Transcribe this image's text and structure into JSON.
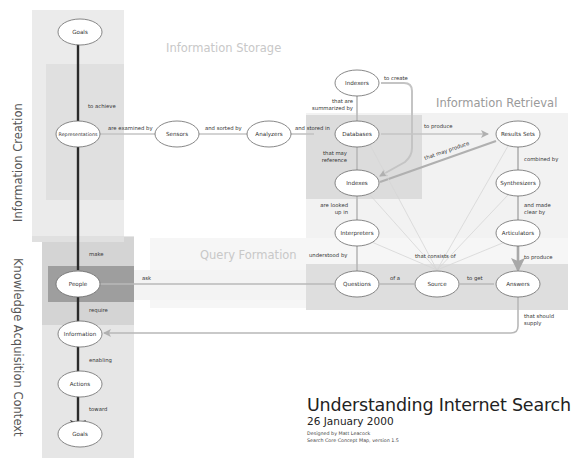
{
  "title": {
    "main": "Understanding Internet Search",
    "date": "26 January 2000",
    "designer": "Designed by Matt Leacock",
    "subtitle": "Search Core Concept Map, version 1.5"
  },
  "side_titles": {
    "information_creation": "Information Creation",
    "knowledge_acquisition": "Knowledge Acquisition Context"
  },
  "region_titles": {
    "information_storage": "Information Storage",
    "information_retrieval": "Information Retrieval",
    "query_formation": "Query Formation"
  },
  "colors": {
    "panel_light": "#ebebeb",
    "panel_mid": "#dcdcdc",
    "panel_dark": "#9e9e9e",
    "edge_gray": "#b5b5b5",
    "edge_dark": "#2a2a2a",
    "region_title": "#c8c8c8"
  },
  "nodes": {
    "goals_top": "Goals",
    "representations": "Representations",
    "sensors": "Sensors",
    "analyzers": "Analyzers",
    "indexers": "Indexers",
    "databases": "Databases",
    "indexes": "Indexes",
    "interpreters": "Interpreters",
    "results_sets": "Results Sets",
    "synthesizers": "Synthesizers",
    "articulators": "Articulators",
    "people": "People",
    "questions": "Questions",
    "source": "Source",
    "answers": "Answers",
    "information": "Information",
    "actions": "Actions",
    "goals_bottom": "Goals"
  },
  "edges": {
    "to_achieve": "to achieve",
    "are_examined_by": "are examined by",
    "and_sorted_by": "and sorted by",
    "and_stored_in": "and stored in",
    "to_create": "to create",
    "that_are": "that are",
    "summarized_by": "summarized by",
    "to_produce_results": "to produce",
    "that_may_produce": "that may produce",
    "that_may": "that may",
    "reference": "reference",
    "combined_by": "combined by",
    "are_looked": "are looked",
    "up_in": "up in",
    "and_made": "and made",
    "clear_by": "clear by",
    "make": "make",
    "understood_by": "understood by",
    "that_consists_of": "that consists of",
    "to_produce_answers": "to produce",
    "ask": "ask",
    "of_a": "of a",
    "to_get": "to get",
    "require": "require",
    "that_should": "that should",
    "supply": "supply",
    "enabling": "enabling",
    "toward": "toward"
  }
}
